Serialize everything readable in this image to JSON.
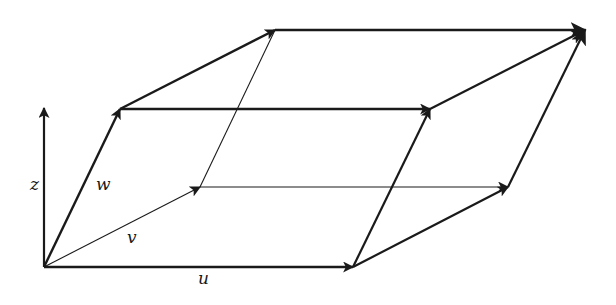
{
  "diagram": {
    "labels": {
      "z_axis": "z",
      "u": "u",
      "v": "v",
      "w": "w"
    },
    "colors": {
      "stroke": "#1a1a1a",
      "background": "#ffffff"
    },
    "vertices": {
      "origin": [
        44,
        267
      ],
      "u_end": [
        353,
        267
      ],
      "v_end": [
        200,
        187
      ],
      "w_end": [
        120,
        109
      ],
      "u_plus_v": [
        508,
        187
      ],
      "u_plus_w": [
        430,
        109
      ],
      "v_plus_w": [
        275,
        30
      ],
      "u_plus_v_plus_w": [
        585,
        30
      ],
      "z_axis_top": [
        44,
        108
      ]
    }
  }
}
